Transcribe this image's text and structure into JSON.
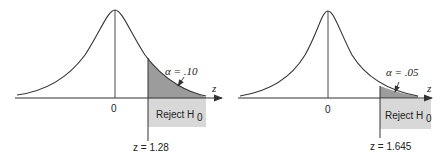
{
  "panels": [
    {
      "alpha_label": "α = .10",
      "zero_label": "0",
      "axis_label": "z",
      "reject_label": "Reject H",
      "reject_sub": "0",
      "critical_label": "z = 1.28",
      "critical_z": 1.28,
      "alpha": 0.1
    },
    {
      "alpha_label": "α = .05",
      "zero_label": "0",
      "axis_label": "z",
      "reject_label": "Reject H",
      "reject_sub": "0",
      "critical_label": "z = 1.645",
      "critical_z": 1.645,
      "alpha": 0.05
    }
  ],
  "colors": {
    "tail_fill": "#9c9c9c",
    "reject_box": "#d8d8d8",
    "line": "#333333"
  }
}
